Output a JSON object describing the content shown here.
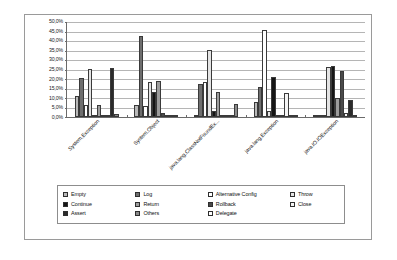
{
  "chart_data": {
    "type": "bar",
    "title": "",
    "xlabel": "",
    "ylabel": "",
    "ylim": [
      0,
      50
    ],
    "grid": true,
    "legend_position": "bottom",
    "ytick_labels": [
      "50,0%",
      "45,0%",
      "40,0%",
      "35,0%",
      "30,0%",
      "25,0%",
      "20,0%",
      "15,0%",
      "10,0%",
      "5,0%",
      "0,0%"
    ],
    "ytick_values": [
      50,
      45,
      40,
      35,
      30,
      25,
      20,
      15,
      10,
      5,
      0
    ],
    "categories": [
      "System.Exception",
      "System.Object",
      "java.lang.ClassNotFoundEx...",
      "java.lang.Exception",
      "java.IO.IOException"
    ],
    "series": [
      {
        "name": "Empty",
        "values": [
          11.0,
          6.5,
          0.5,
          8.0,
          0.8
        ]
      },
      {
        "name": "Log",
        "values": [
          20.5,
          42.0,
          17.0,
          15.5,
          0.8
        ]
      },
      {
        "name": "Alternative Config",
        "values": [
          6.5,
          5.5,
          18.0,
          45.5,
          0.3
        ]
      },
      {
        "name": "Throw",
        "values": [
          25.0,
          18.0,
          35.0,
          3.0,
          26.0
        ]
      },
      {
        "name": "Continue",
        "values": [
          0.6,
          13.0,
          3.0,
          21.0,
          26.5
        ]
      },
      {
        "name": "Return",
        "values": [
          6.5,
          18.5,
          13.0,
          1.0,
          10.0
        ]
      },
      {
        "name": "Rollback",
        "values": [
          0.5,
          2.0,
          0.5,
          0.5,
          24.0
        ]
      },
      {
        "name": "Close",
        "values": [
          0.6,
          0.8,
          0.5,
          12.5,
          2.0
        ]
      },
      {
        "name": "Assert",
        "values": [
          25.5,
          0.4,
          0.4,
          0.8,
          9.0
        ]
      },
      {
        "name": "Others",
        "values": [
          1.5,
          0.3,
          7.0,
          1.2,
          0.6
        ]
      },
      {
        "name": "Delegate",
        "values": [
          0,
          0,
          0,
          0,
          0
        ]
      }
    ],
    "legend_entries": [
      {
        "label": "Empty",
        "swatch": "f0"
      },
      {
        "label": "Log",
        "swatch": "f1"
      },
      {
        "label": "Alternative Config",
        "swatch": "f2"
      },
      {
        "label": "Throw",
        "swatch": "f3"
      },
      {
        "label": "Continue",
        "swatch": "f4"
      },
      {
        "label": "Return",
        "swatch": "f5"
      },
      {
        "label": "Rollback",
        "swatch": "f6"
      },
      {
        "label": "Close",
        "swatch": "f7"
      },
      {
        "label": "Assert",
        "swatch": "f8"
      },
      {
        "label": "Others",
        "swatch": "f9"
      },
      {
        "label": "Delegate",
        "swatch": "f2"
      }
    ]
  }
}
